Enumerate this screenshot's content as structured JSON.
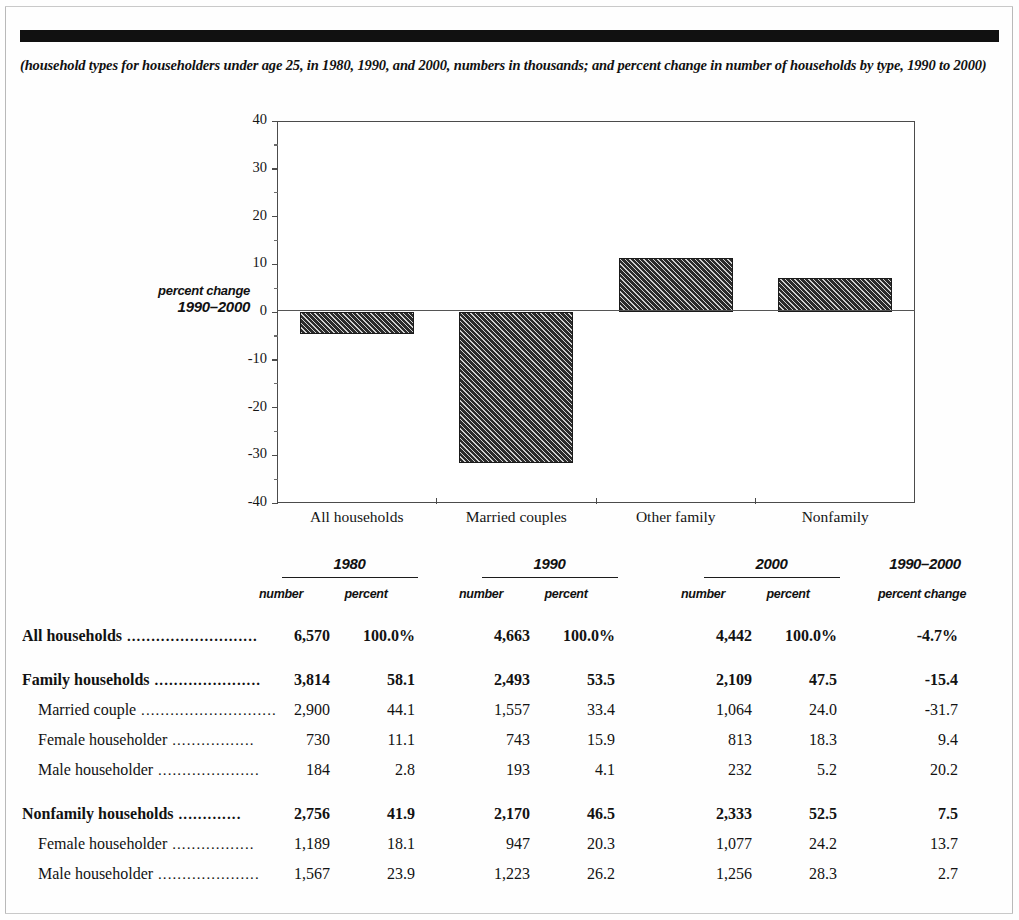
{
  "document": {
    "caption": "(household types for householders under age 25, in 1980, 1990, and 2000, numbers in thousands; and percent change in number of households by type, 1990 to 2000)"
  },
  "chart_data": {
    "type": "bar",
    "title": "",
    "axis_title_line1": "percent change",
    "axis_title_line2": "1990–2000",
    "categories": [
      "All households",
      "Married couples",
      "Other family",
      "Nonfamily"
    ],
    "values": [
      -4.7,
      -31.7,
      11.4,
      7.2
    ],
    "ylabel": "percent change 1990–2000",
    "xlabel": "",
    "ylim": [
      -40,
      40
    ],
    "yticks": [
      40,
      30,
      20,
      10,
      0,
      -10,
      -20,
      -30,
      -40
    ],
    "ytick_labels": [
      "40",
      "30",
      "20",
      "10",
      "0",
      "-10",
      "-20",
      "-30",
      "-40"
    ],
    "grid": false,
    "legend": false,
    "bar_fill": "#2c2c2c",
    "bar_pattern": "diagonal-hatch"
  },
  "table": {
    "group_headers": [
      {
        "label": "1980",
        "ruled": true
      },
      {
        "label": "1990",
        "ruled": true
      },
      {
        "label": "2000",
        "ruled": true
      },
      {
        "label": "1990–2000",
        "ruled": false
      }
    ],
    "column_headers": [
      "number",
      "percent",
      "number",
      "percent",
      "number",
      "percent",
      "percent change"
    ],
    "leader": " ..............................",
    "rows": [
      {
        "label": "All households",
        "leader": " ...........................",
        "indent": false,
        "bold": true,
        "spacer_before": false,
        "values": [
          "6,570",
          "100.0%",
          "4,663",
          "100.0%",
          "4,442",
          "100.0%",
          "-4.7%"
        ]
      },
      {
        "label": "Family households",
        "leader": " ......................",
        "indent": false,
        "bold": true,
        "spacer_before": true,
        "values": [
          "3,814",
          "58.1",
          "2,493",
          "53.5",
          "2,109",
          "47.5",
          "-15.4"
        ]
      },
      {
        "label": "Married couple",
        "leader": " ............................",
        "indent": true,
        "bold": false,
        "spacer_before": false,
        "values": [
          "2,900",
          "44.1",
          "1,557",
          "33.4",
          "1,064",
          "24.0",
          "-31.7"
        ]
      },
      {
        "label": "Female householder",
        "leader": " .................",
        "indent": true,
        "bold": false,
        "spacer_before": false,
        "values": [
          "730",
          "11.1",
          "743",
          "15.9",
          "813",
          "18.3",
          "9.4"
        ]
      },
      {
        "label": "Male householder",
        "leader": " .....................",
        "indent": true,
        "bold": false,
        "spacer_before": false,
        "values": [
          "184",
          "2.8",
          "193",
          "4.1",
          "232",
          "5.2",
          "20.2"
        ]
      },
      {
        "label": "Nonfamily households",
        "leader": " .............",
        "indent": false,
        "bold": true,
        "spacer_before": true,
        "values": [
          "2,756",
          "41.9",
          "2,170",
          "46.5",
          "2,333",
          "52.5",
          "7.5"
        ]
      },
      {
        "label": "Female householder",
        "leader": " .................",
        "indent": true,
        "bold": false,
        "spacer_before": false,
        "values": [
          "1,189",
          "18.1",
          "947",
          "20.3",
          "1,077",
          "24.2",
          "13.7"
        ]
      },
      {
        "label": "Male householder",
        "leader": " .....................",
        "indent": true,
        "bold": false,
        "spacer_before": false,
        "values": [
          "1,567",
          "23.9",
          "1,223",
          "26.2",
          "1,256",
          "28.3",
          "2.7"
        ]
      }
    ]
  }
}
